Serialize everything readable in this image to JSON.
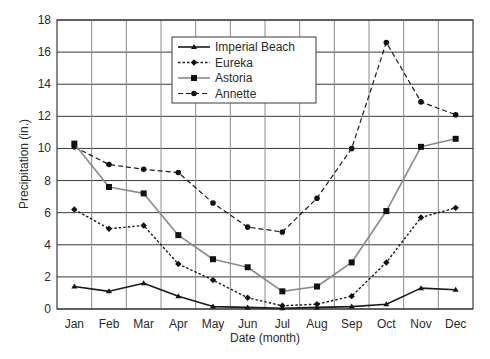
{
  "chart_data": {
    "type": "line",
    "title": "",
    "xlabel": "Date (month)",
    "ylabel": "Precipitation (in.)",
    "ylim": [
      0,
      18
    ],
    "yticks": [
      0,
      2,
      4,
      6,
      8,
      10,
      12,
      14,
      16,
      18
    ],
    "grid": true,
    "legend_position": "upper-center",
    "categories": [
      "Jan",
      "Feb",
      "Mar",
      "Apr",
      "May",
      "Jun",
      "Jul",
      "Aug",
      "Sep",
      "Oct",
      "Nov",
      "Dec"
    ],
    "series": [
      {
        "name": "Imperial Beach",
        "line_style": "solid",
        "marker": "triangle",
        "color": "#1a1a1a",
        "values": [
          1.4,
          1.1,
          1.6,
          0.8,
          0.15,
          0.1,
          0.05,
          0.1,
          0.15,
          0.3,
          1.3,
          1.2
        ]
      },
      {
        "name": "Eureka",
        "line_style": "dotted",
        "marker": "diamond",
        "color": "#1a1a1a",
        "values": [
          6.2,
          5.0,
          5.2,
          2.8,
          1.8,
          0.7,
          0.2,
          0.3,
          0.8,
          2.9,
          5.7,
          6.3
        ]
      },
      {
        "name": "Astoria",
        "line_style": "solid-gray",
        "marker": "square",
        "color": "#8a8a8a",
        "values": [
          10.3,
          7.6,
          7.2,
          4.6,
          3.1,
          2.6,
          1.1,
          1.4,
          2.9,
          6.1,
          10.1,
          10.6
        ]
      },
      {
        "name": "Annette",
        "line_style": "dashed",
        "marker": "circle",
        "color": "#1a1a1a",
        "values": [
          10.1,
          9.0,
          8.7,
          8.5,
          6.6,
          5.1,
          4.8,
          6.9,
          10.0,
          16.6,
          12.9,
          12.1
        ]
      }
    ]
  }
}
